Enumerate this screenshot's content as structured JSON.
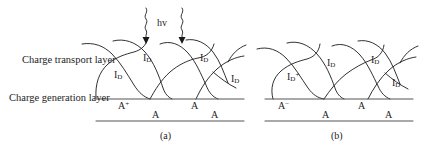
{
  "figure": {
    "side_labels": {
      "transport": "Charge transport layer",
      "generation": "Charge generation layer"
    },
    "photon_label": "hv",
    "colors": {
      "ink": "#1a1a1a",
      "line": "#4a4a4a",
      "curve": "#111111",
      "background": "#ffffff"
    },
    "panels": [
      {
        "id": "a",
        "caption": "(a)",
        "chain_labels": [
          {
            "base": "I",
            "sub": "D",
            "sup": ""
          },
          {
            "base": "I",
            "sub": "D",
            "sup": ""
          },
          {
            "base": "I",
            "sub": "D",
            "sup": ""
          },
          {
            "base": "I",
            "sub": "D",
            "sup": ""
          }
        ],
        "interface_species": [
          {
            "base": "A",
            "sup": "+"
          },
          {
            "base": "A",
            "sup": ""
          }
        ],
        "substrate_species": [
          {
            "base": "A",
            "sup": ""
          },
          {
            "base": "A",
            "sup": ""
          }
        ],
        "photon_arrows": 2
      },
      {
        "id": "b",
        "caption": "(b)",
        "chain_labels": [
          {
            "base": "I",
            "sub": "D",
            "sup": "+"
          },
          {
            "base": "I",
            "sub": "D",
            "sup": ""
          },
          {
            "base": "I",
            "sub": "D",
            "sup": ""
          },
          {
            "base": "I",
            "sub": "D",
            "sup": ""
          }
        ],
        "interface_species": [
          {
            "base": "A",
            "sup": "−"
          },
          {
            "base": "A",
            "sup": ""
          }
        ],
        "substrate_species": [
          {
            "base": "A",
            "sup": ""
          },
          {
            "base": "A",
            "sup": ""
          }
        ],
        "photon_arrows": 0
      }
    ]
  }
}
